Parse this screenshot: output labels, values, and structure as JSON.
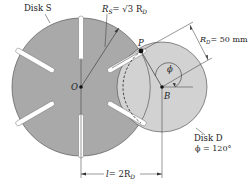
{
  "colors": {
    "disk_s_fill": "#a9a9a9",
    "disk_d_fill": "#d2d2d2",
    "stroke": "#333333",
    "background": "#ffffff"
  },
  "disk_s": {
    "label": "Disk S",
    "center_label": "O",
    "radius_label_symbol": "R",
    "radius_label_sub": "S",
    "radius_label_eq": "= √3 R",
    "radius_label_eq_sub": "D",
    "slot_count": 6
  },
  "disk_d": {
    "label": "Disk D",
    "center_label": "B",
    "angle_label": "ϕ = 120°",
    "angle_symbol": "ϕ",
    "radius_label_symbol": "R",
    "radius_label_sub": "D",
    "radius_label_value": "= 50 mm"
  },
  "pin": {
    "label": "P"
  },
  "dimension": {
    "label_symbol": "l",
    "label_eq": "= 2R",
    "label_sub": "D"
  }
}
